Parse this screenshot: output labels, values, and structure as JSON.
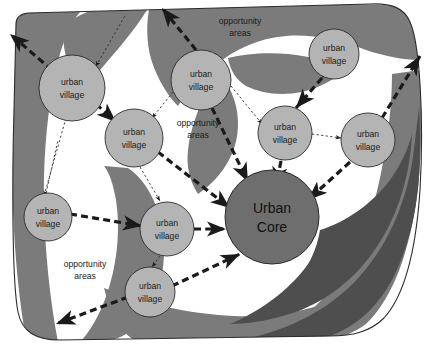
{
  "diagram": {
    "background_color": "#ffffff",
    "colors": {
      "land_white": "#ffffff",
      "corridor_gray": "#7b7b7b",
      "corridor_dark_gray": "#4e4e4e",
      "village_fill": "#b4b4b4",
      "core_fill": "#6e6e6e",
      "outline": "#2b2b2b",
      "arrow": "#1a1a1a",
      "thin_link": "#2b2b2b"
    },
    "nodes": [
      {
        "id": "uv-top-left",
        "label_line1": "urban",
        "label_line2": "village",
        "cx": 72,
        "cy": 88,
        "r": 33,
        "kind": "village"
      },
      {
        "id": "uv-upper-mid",
        "label_line1": "urban",
        "label_line2": "village",
        "cx": 201,
        "cy": 80,
        "r": 30,
        "kind": "village"
      },
      {
        "id": "uv-top-right",
        "label_line1": "urban",
        "label_line2": "village",
        "cx": 334,
        "cy": 54,
        "r": 25,
        "kind": "village"
      },
      {
        "id": "uv-left-mid",
        "label_line1": "urban",
        "label_line2": "village",
        "cx": 134,
        "cy": 138,
        "r": 29,
        "kind": "village"
      },
      {
        "id": "uv-right-mid",
        "label_line1": "urban",
        "label_line2": "village",
        "cx": 285,
        "cy": 133,
        "r": 27,
        "kind": "village"
      },
      {
        "id": "uv-far-right",
        "label_line1": "urban",
        "label_line2": "village",
        "cx": 368,
        "cy": 140,
        "r": 27,
        "kind": "village"
      },
      {
        "id": "uv-lower-left",
        "label_line1": "urban",
        "label_line2": "village",
        "cx": 48,
        "cy": 217,
        "r": 24,
        "kind": "village"
      },
      {
        "id": "uv-lower-mid",
        "label_line1": "urban",
        "label_line2": "village",
        "cx": 167,
        "cy": 229,
        "r": 27,
        "kind": "village"
      },
      {
        "id": "uv-bottom",
        "label_line1": "urban",
        "label_line2": "village",
        "cx": 150,
        "cy": 292,
        "r": 25,
        "kind": "village"
      },
      {
        "id": "urban-core",
        "label_line1": "Urban",
        "label_line2": "Core",
        "cx": 272,
        "cy": 217,
        "r": 47,
        "kind": "core"
      }
    ],
    "area_labels": [
      {
        "id": "opportunity-top",
        "line1": "opportunity",
        "line2": "areas",
        "x": 240,
        "y": 27
      },
      {
        "id": "opportunity-middle",
        "line1": "opportunity",
        "line2": "areas",
        "x": 198,
        "y": 129
      },
      {
        "id": "opportunity-bottom",
        "line1": "opportunity",
        "line2": "areas",
        "x": 85,
        "y": 270
      }
    ],
    "legend_text": {
      "village": "urban village",
      "core": "Urban Core",
      "opportunity": "opportunity areas"
    }
  }
}
